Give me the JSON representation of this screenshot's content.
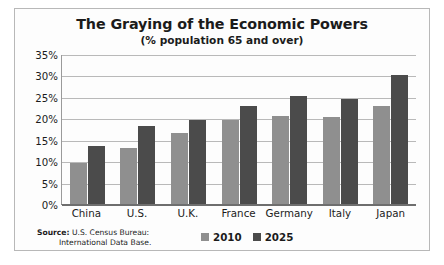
{
  "chart_data": {
    "type": "bar",
    "title": "The Graying of the Economic Powers",
    "subtitle": "(% population 65 and over)",
    "xlabel": "",
    "ylabel": "",
    "ylim": [
      0,
      35
    ],
    "ytick_labels": [
      "35%",
      "30%",
      "25%",
      "20%",
      "15%",
      "10%",
      "5%",
      "0%"
    ],
    "ytick_values": [
      35,
      30,
      25,
      20,
      15,
      10,
      5,
      0
    ],
    "grid": true,
    "legend_position": "bottom-center",
    "categories": [
      "China",
      "U.S.",
      "U.K.",
      "France",
      "Germany",
      "Italy",
      "Japan"
    ],
    "series": [
      {
        "name": "2010",
        "color": "#8f8f8f",
        "values": [
          9.6,
          13.0,
          16.6,
          19.5,
          20.5,
          20.4,
          22.8
        ]
      },
      {
        "name": "2025",
        "color": "#4b4b4b",
        "values": [
          13.6,
          18.2,
          19.6,
          22.8,
          25.1,
          24.5,
          30.1
        ]
      }
    ]
  },
  "source": {
    "label": "Source:",
    "line1": "U.S. Census Bureau:",
    "line2": "International Data Base."
  },
  "colors": {
    "series_2010": "#8f8f8f",
    "series_2025": "#4b4b4b",
    "grid": "#b9b9b9",
    "axis": "#6e6e6e",
    "text": "#1b1b1b",
    "frame": "#b8b8b8"
  }
}
